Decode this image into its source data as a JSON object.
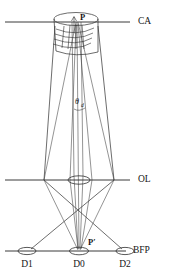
{
  "figure": {
    "type": "optical-ray-diagram",
    "background_color": "#ffffff",
    "line_color": "#2e2e2e"
  },
  "planes": [
    {
      "id": "ca",
      "label": "CA",
      "y": 22,
      "label_x": 138,
      "line_x1": 5,
      "line_x2": 130
    },
    {
      "id": "ol",
      "label": "OL",
      "y": 180,
      "label_x": 138,
      "line_x1": 5,
      "line_x2": 130
    },
    {
      "id": "bfp",
      "label": "BFP",
      "y": 251,
      "label_x": 133,
      "line_x1": 5,
      "line_x2": 126
    }
  ],
  "points": [
    {
      "id": "p",
      "label": "P",
      "x": 78,
      "y": 20,
      "label_dx": 4,
      "label_dy": -1
    },
    {
      "id": "p-prime",
      "label": "P′",
      "x": 79,
      "y": 248,
      "label_dx": 9,
      "label_dy": -5
    }
  ],
  "angle": {
    "symbol": "θ",
    "subscript": "d",
    "x": 79,
    "y": 103
  },
  "detectors": [
    {
      "id": "d1",
      "label": "D1",
      "cx": 27,
      "cy": 251,
      "rx": 9,
      "ry": 3.6,
      "label_y": 265
    },
    {
      "id": "d0",
      "label": "D0",
      "cx": 79,
      "cy": 251,
      "rx": 9.5,
      "ry": 3.8,
      "label_y": 265
    },
    {
      "id": "d2",
      "label": "D2",
      "cx": 125,
      "cy": 251,
      "rx": 9,
      "ry": 3.6,
      "label_y": 265
    }
  ],
  "objective_lens": {
    "id": "ol-aperture",
    "cx": 79,
    "cy": 180,
    "rx": 11,
    "ry": 4.2
  },
  "specimen_cylinder": {
    "id": "specimen",
    "cx": 76,
    "top_cy": 19,
    "rx": 22,
    "ry": 6.5,
    "height": 32
  },
  "wavefronts": {
    "count": 4,
    "note": "diffracted wavefront arcs below specimen apex"
  },
  "rays": {
    "outer_envelope_note": "Wide cone from specimen edges converging at objective lens then to D1/D2",
    "inner_cone_note": "Narrow axial cone from P converging at P' on BFP"
  }
}
